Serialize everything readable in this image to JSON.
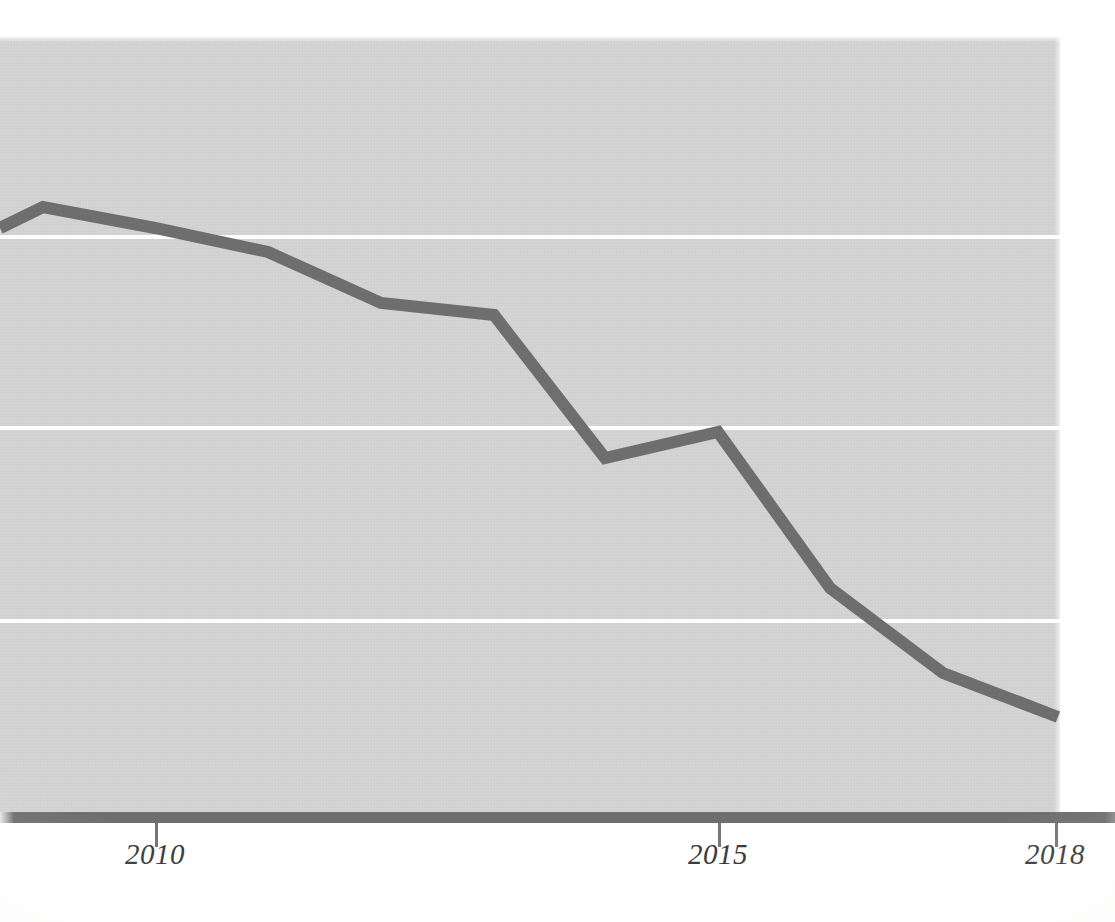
{
  "chart_data": {
    "type": "line",
    "title": "",
    "subtitle": "",
    "xlabel": "",
    "ylabel": "",
    "x": [
      2009,
      2010,
      2011,
      2012,
      2013,
      2014,
      2015,
      2016,
      2017,
      2018
    ],
    "series": [
      {
        "name": "series-1",
        "values": [
          79.0,
          76.3,
          73.2,
          66.5,
          65.0,
          46.4,
          49.8,
          29.5,
          18.4,
          12.6
        ],
        "color": "#6e6e6e"
      }
    ],
    "xtick_labels": [
      "2010",
      "2015",
      "2018"
    ],
    "xtick_values": [
      2010,
      2015,
      2018
    ],
    "xlim": [
      2008.6,
      2018.0
    ],
    "ylim": [
      0,
      100
    ],
    "ytick_labels": [],
    "gridlines": {
      "horizontal": true,
      "vertical": false,
      "color": "#ffffff",
      "y_values": [
        75,
        50,
        25
      ]
    },
    "legend": {
      "visible": false,
      "position": "none",
      "entries": []
    },
    "annotations": [],
    "plot_background": "#d4d4d4",
    "page_background": "#ffffff",
    "axis_color": "#6e6e6e",
    "line_width_px": 12
  },
  "axis": {
    "ticks": [
      {
        "label": "2010",
        "x_px": 155
      },
      {
        "label": "2015",
        "x_px": 718
      },
      {
        "label": "2018",
        "x_px": 1055
      }
    ]
  },
  "gridlines": [
    {
      "y_px": 236
    },
    {
      "y_px": 427
    },
    {
      "y_px": 620
    }
  ],
  "series_path": {
    "points_px": "0,228 43,207 155,228 268,252 381,303 494,315 605,458 718,432 830,588 943,673 1058,717"
  },
  "colors": {
    "line": "#6e6e6e",
    "plot_background": "#d4d4d4",
    "gridline": "#ffffff",
    "axis": "#6e6e6e",
    "tick_label": "#3b3b3b"
  }
}
